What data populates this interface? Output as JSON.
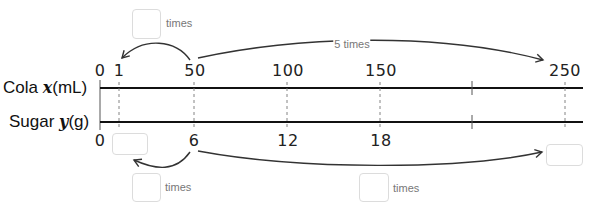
{
  "rows": {
    "cola": {
      "name": "Cola",
      "var": "x",
      "unit": "(mL)"
    },
    "sugar": {
      "name": "Sugar",
      "var": "y",
      "unit": "(g)"
    }
  },
  "cola_ticks": [
    "0",
    "1",
    "50",
    "100",
    "150",
    "",
    "250"
  ],
  "sugar_ticks": [
    "0",
    "",
    "6",
    "12",
    "18",
    "",
    ""
  ],
  "arcs": {
    "top_long_label": "5 times",
    "top_short_times": "times",
    "bottom_short_times": "times",
    "bottom_long_times": "times"
  },
  "answer_boxes": {
    "top_short_multiplier": "",
    "sugar_at_1": "",
    "bottom_short_multiplier": "",
    "sugar_at_250": "",
    "bottom_long_multiplier": ""
  }
}
